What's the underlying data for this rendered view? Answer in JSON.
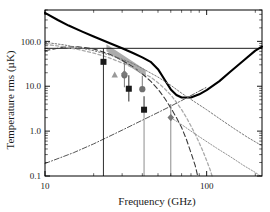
{
  "chart_data": {
    "type": "line",
    "title": "",
    "xlabel": "Frequency (GHz)",
    "ylabel": "Temperature rms (µK)",
    "xscale": "log",
    "yscale": "log",
    "xlim": [
      10,
      220
    ],
    "ylim": [
      0.1,
      500
    ],
    "xticks": [
      10,
      100
    ],
    "xtick_labels": [
      "10",
      "100"
    ],
    "yticks": [
      0.1,
      1.0,
      10.0,
      100.0
    ],
    "ytick_labels": [
      "0.1",
      "1.0",
      "10.0",
      "100.0"
    ],
    "grid": false,
    "legend": "none",
    "series": [
      {
        "name": "total-foreground-plus-cmb",
        "style": "solid-thick-black",
        "color": "#000000",
        "points": [
          [
            10,
            430
          ],
          [
            12,
            300
          ],
          [
            14,
            225
          ],
          [
            17,
            165
          ],
          [
            20,
            128
          ],
          [
            25,
            92
          ],
          [
            30,
            70
          ],
          [
            35,
            55
          ],
          [
            40,
            44
          ],
          [
            45,
            35
          ],
          [
            50,
            24
          ],
          [
            55,
            14
          ],
          [
            60,
            8.5
          ],
          [
            65,
            6.4
          ],
          [
            70,
            5.6
          ],
          [
            80,
            5.6
          ],
          [
            90,
            6.6
          ],
          [
            100,
            8.2
          ],
          [
            120,
            13
          ],
          [
            140,
            21
          ],
          [
            170,
            38
          ],
          [
            200,
            62
          ],
          [
            220,
            76
          ]
        ]
      },
      {
        "name": "cmb-anisotropy-flat",
        "style": "solid-thin-black",
        "color": "#000000",
        "points": [
          [
            10,
            70
          ],
          [
            220,
            70
          ]
        ]
      },
      {
        "name": "synchrotron",
        "style": "dashed-dark",
        "color": "#3a3a3a",
        "points": [
          [
            10,
            62
          ],
          [
            13,
            74
          ],
          [
            16,
            76
          ],
          [
            20,
            68
          ],
          [
            25,
            52
          ],
          [
            30,
            38
          ],
          [
            35,
            27
          ],
          [
            40,
            19
          ],
          [
            45,
            13
          ],
          [
            50,
            8.6
          ],
          [
            55,
            5.4
          ],
          [
            60,
            3.3
          ],
          [
            65,
            2.0
          ],
          [
            70,
            1.2
          ],
          [
            75,
            0.65
          ],
          [
            80,
            0.33
          ],
          [
            85,
            0.17
          ],
          [
            88,
            0.1
          ]
        ]
      },
      {
        "name": "free-free",
        "style": "dotted-gray",
        "color": "#777777",
        "points": [
          [
            10,
            95
          ],
          [
            13,
            84
          ],
          [
            16,
            73
          ],
          [
            20,
            62
          ],
          [
            25,
            50
          ],
          [
            30,
            40
          ],
          [
            35,
            32
          ],
          [
            40,
            25
          ],
          [
            50,
            16
          ],
          [
            60,
            10.5
          ],
          [
            70,
            7.0
          ],
          [
            85,
            4.4
          ],
          [
            100,
            3.0
          ],
          [
            120,
            1.9
          ],
          [
            150,
            1.1
          ],
          [
            180,
            0.72
          ],
          [
            210,
            0.52
          ],
          [
            220,
            0.48
          ]
        ]
      },
      {
        "name": "spinning-dust",
        "style": "dashed-light-gray",
        "color": "#aaaaaa",
        "points": [
          [
            10,
            86
          ],
          [
            13,
            76
          ],
          [
            16,
            66
          ],
          [
            20,
            55
          ],
          [
            25,
            43
          ],
          [
            30,
            33
          ],
          [
            35,
            26
          ],
          [
            40,
            20
          ],
          [
            45,
            16
          ],
          [
            50,
            12
          ],
          [
            55,
            8.8
          ],
          [
            60,
            6.4
          ],
          [
            65,
            4.4
          ],
          [
            70,
            3.0
          ],
          [
            75,
            2.0
          ],
          [
            80,
            1.3
          ],
          [
            85,
            0.85
          ],
          [
            90,
            0.55
          ],
          [
            95,
            0.35
          ],
          [
            100,
            0.22
          ],
          [
            105,
            0.14
          ],
          [
            108,
            0.1
          ]
        ]
      },
      {
        "name": "thermal-dust",
        "style": "dashdot-gray",
        "color": "#555555",
        "points": [
          [
            10,
            0.19
          ],
          [
            15,
            0.33
          ],
          [
            20,
            0.52
          ],
          [
            30,
            1.05
          ],
          [
            40,
            1.75
          ],
          [
            50,
            2.6
          ],
          [
            60,
            3.6
          ],
          [
            70,
            4.8
          ],
          [
            80,
            6.2
          ],
          [
            90,
            7.8
          ],
          [
            100,
            9.5
          ]
        ]
      },
      {
        "name": "secondary-dust-branch",
        "style": "dotted-thin-gray",
        "color": "#888888",
        "points": [
          [
            60,
            2.0
          ],
          [
            70,
            1.4
          ],
          [
            80,
            1.0
          ],
          [
            95,
            0.66
          ],
          [
            115,
            0.42
          ],
          [
            140,
            0.27
          ],
          [
            170,
            0.17
          ],
          [
            200,
            0.12
          ],
          [
            215,
            0.1
          ]
        ]
      }
    ],
    "shaded_bands": [
      {
        "name": "wmap-sensitivity-band",
        "color": "#909090",
        "opacity": 0.75,
        "polygon": [
          [
            24,
            86
          ],
          [
            24,
            60
          ],
          [
            42,
            16
          ],
          [
            42,
            23
          ]
        ]
      }
    ],
    "markers": [
      {
        "name": "black-square",
        "symbol": "square",
        "color": "#1a1a1a",
        "x": 23,
        "y": 35,
        "yerr_low": 35,
        "yerr_high": 35
      },
      {
        "name": "black-square",
        "symbol": "square",
        "color": "#1a1a1a",
        "x": 33,
        "y": 8.8,
        "yerr_low": 4.2,
        "yerr_high": 8.8
      },
      {
        "name": "black-square",
        "symbol": "square",
        "color": "#1a1a1a",
        "x": 41,
        "y": 3.0,
        "yerr_low": 0.1,
        "yerr_high": 3.0
      },
      {
        "name": "gray-circle",
        "symbol": "circle",
        "color": "#707070",
        "x": 31,
        "y": 17.5,
        "yerr_low": 8.0,
        "yerr_high": 17.5
      },
      {
        "name": "gray-circle",
        "symbol": "circle",
        "color": "#707070",
        "x": 40,
        "y": 8.6,
        "yerr_low": 0.1,
        "yerr_high": 8.6
      },
      {
        "name": "gray-triangle",
        "symbol": "triangle",
        "color": "#999999",
        "x": 27,
        "y": 18.0
      },
      {
        "name": "gray-diamond",
        "symbol": "diamond",
        "color": "#777777",
        "x": 60,
        "y": 2.0,
        "yerr_low": 0.1,
        "yerr_high": 2.0
      },
      {
        "name": "gray-diamond",
        "symbol": "diamond",
        "color": "#7a7a7a",
        "x": 31,
        "y": 19.0
      }
    ],
    "drop_lines": [
      {
        "name": "drop-line-41ghz",
        "x": 41,
        "y_top": 3.0,
        "y_bottom": 0.1
      },
      {
        "name": "drop-line-60ghz",
        "x": 60,
        "y_top": 2.0,
        "y_bottom": 0.1
      }
    ]
  },
  "colors": {
    "axis": "#000000",
    "background": "#ffffff",
    "band": "#909090",
    "marker_black": "#1a1a1a",
    "marker_gray": "#777777"
  }
}
